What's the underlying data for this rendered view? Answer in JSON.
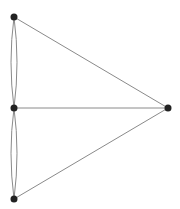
{
  "diagram": {
    "type": "graph",
    "background": "#ffffff",
    "edge_color": "#8a8a8a",
    "node_color": "#222222",
    "node_radius": 3.5,
    "nodes": [
      {
        "id": "A",
        "x": 14,
        "y": 17
      },
      {
        "id": "B",
        "x": 14,
        "y": 108
      },
      {
        "id": "C",
        "x": 14,
        "y": 199
      },
      {
        "id": "D",
        "x": 168,
        "y": 108
      }
    ],
    "edges": [
      {
        "from": "A",
        "to": "B",
        "path": "M14 17 Q8 62 14 108"
      },
      {
        "from": "A",
        "to": "B",
        "path": "M14 17 Q20 62 14 108"
      },
      {
        "from": "B",
        "to": "C",
        "path": "M14 108 Q8 153 14 199"
      },
      {
        "from": "B",
        "to": "C",
        "path": "M14 108 Q20 153 14 199"
      },
      {
        "from": "A",
        "to": "D",
        "path": "M14 17 L168 108"
      },
      {
        "from": "B",
        "to": "D",
        "path": "M14 108 L168 108"
      },
      {
        "from": "C",
        "to": "D",
        "path": "M14 199 L168 108"
      }
    ]
  }
}
